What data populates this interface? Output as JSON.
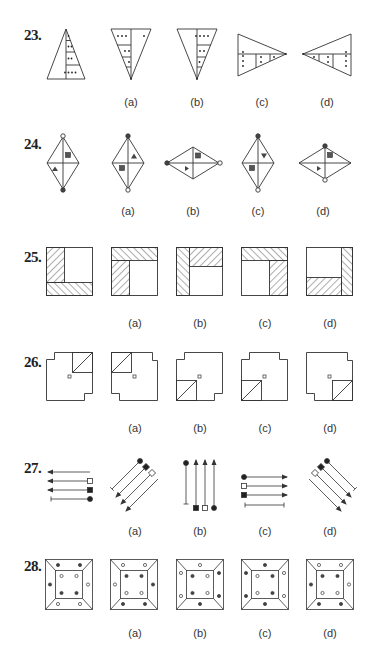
{
  "questions": [
    {
      "number": "23.",
      "options": [
        "(a)",
        "(b)",
        "(c)",
        "(d)"
      ],
      "figure_type": "triangle-with-dots"
    },
    {
      "number": "24.",
      "options": [
        "(a)",
        "(b)",
        "(c)",
        "(d)"
      ],
      "figure_type": "rhombus-with-shapes"
    },
    {
      "number": "25.",
      "options": [
        "(a)",
        "(b)",
        "(c)",
        "(d)"
      ],
      "figure_type": "square-with-hatching"
    },
    {
      "number": "26.",
      "options": [
        "(a)",
        "(b)",
        "(c)",
        "(d)"
      ],
      "figure_type": "notched-square-with-triangle"
    },
    {
      "number": "27.",
      "options": [
        "(a)",
        "(b)",
        "(c)",
        "(d)"
      ],
      "figure_type": "arrows-with-markers"
    },
    {
      "number": "28.",
      "options": [
        "(a)",
        "(b)",
        "(c)",
        "(d)"
      ],
      "figure_type": "frame-with-dots"
    }
  ],
  "colors": {
    "line": "#333333",
    "fill_dark": "#444444",
    "fill_light": "#ffffff",
    "background": "#ffffff"
  }
}
